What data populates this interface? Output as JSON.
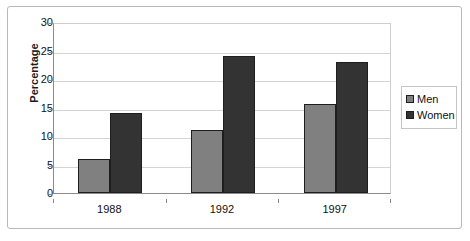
{
  "chart_data": {
    "type": "bar",
    "title": "",
    "xlabel": "",
    "ylabel": "Percentage",
    "categories": [
      "1988",
      "1992",
      "1997"
    ],
    "series": [
      {
        "name": "Men",
        "color": "#808080",
        "values": [
          6,
          11,
          15.7
        ]
      },
      {
        "name": "Women",
        "color": "#333333",
        "values": [
          14,
          24,
          23
        ]
      }
    ],
    "ylim": [
      0,
      30
    ],
    "ytick_step": 5,
    "yticks": [
      "0",
      "5",
      "10",
      "15",
      "20",
      "25",
      "30"
    ],
    "grid": true,
    "legend_position": "right",
    "bar_outline_color": "#1e1e1e",
    "frame_color": "#b9b9b9",
    "axis_color": "#8a8a8a",
    "gridline_color": "#d4d4d4",
    "background": "#ffffff"
  },
  "legend": {
    "entries": [
      {
        "label": "Men"
      },
      {
        "label": "Women"
      }
    ]
  }
}
